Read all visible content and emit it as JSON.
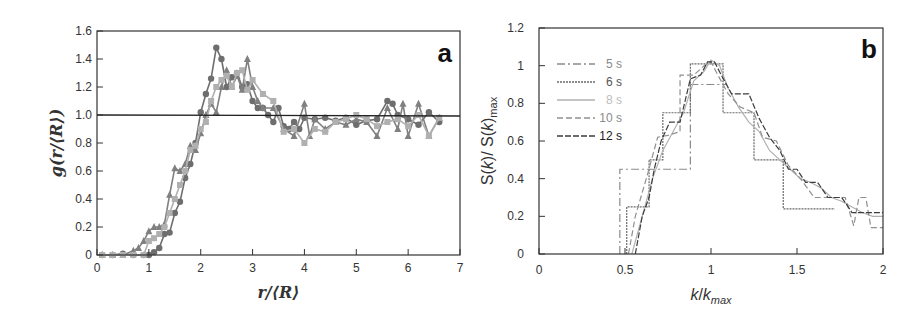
{
  "chart_data": [
    {
      "panel": "a",
      "type": "line",
      "title": "",
      "xlabel": "r/⟨R⟩",
      "ylabel": "g(r/⟨R⟩)",
      "xlim": [
        0,
        7
      ],
      "ylim": [
        0,
        1.6
      ],
      "xticks": [
        "0",
        "1",
        "2",
        "3",
        "4",
        "5",
        "6",
        "7"
      ],
      "yticks": [
        "0",
        "0.2",
        "0.4",
        "0.6",
        "0.8",
        "1.0",
        "1.2",
        "1.4",
        "1.6"
      ],
      "reference_line": 1.0,
      "grid": false,
      "legend": null,
      "series": [
        {
          "name": "circles",
          "marker": "circle",
          "color": "#6e6e6e",
          "x": [
            0.1,
            0.3,
            0.5,
            0.7,
            0.9,
            1.0,
            1.1,
            1.2,
            1.3,
            1.4,
            1.5,
            1.6,
            1.7,
            1.8,
            1.9,
            2.0,
            2.1,
            2.2,
            2.3,
            2.4,
            2.5,
            2.6,
            2.7,
            2.8,
            2.9,
            3.0,
            3.1,
            3.2,
            3.3,
            3.4,
            3.5,
            3.6,
            3.7,
            3.8,
            3.9,
            4.0,
            4.2,
            4.4,
            4.6,
            4.8,
            5.0,
            5.2,
            5.4,
            5.6,
            5.7,
            5.8,
            6.0,
            6.2,
            6.4,
            6.6
          ],
          "y": [
            0,
            0,
            0.01,
            0,
            0,
            0,
            0.02,
            0.05,
            0.15,
            0.16,
            0.3,
            0.38,
            0.55,
            0.65,
            0.8,
            1.02,
            1.15,
            1.26,
            1.48,
            1.4,
            1.2,
            1.27,
            1.3,
            1.2,
            1.22,
            1.1,
            1.05,
            1.05,
            1.0,
            0.95,
            1.05,
            0.92,
            0.9,
            0.95,
            0.9,
            0.98,
            0.97,
            0.98,
            0.96,
            0.98,
            0.93,
            0.96,
            0.97,
            1.1,
            1.08,
            1.0,
            0.97,
            0.93,
            1.02,
            0.95
          ]
        },
        {
          "name": "triangles",
          "marker": "triangle",
          "color": "#808080",
          "x": [
            0.1,
            0.3,
            0.5,
            0.7,
            0.8,
            0.9,
            1.0,
            1.1,
            1.2,
            1.3,
            1.4,
            1.5,
            1.6,
            1.7,
            1.8,
            1.9,
            2.0,
            2.1,
            2.2,
            2.3,
            2.4,
            2.5,
            2.6,
            2.7,
            2.8,
            2.9,
            3.0,
            3.1,
            3.2,
            3.4,
            3.6,
            3.8,
            4.0,
            4.1,
            4.2,
            4.4,
            4.6,
            4.8,
            5.0,
            5.2,
            5.4,
            5.6,
            5.8,
            5.9,
            6.0,
            6.2,
            6.4,
            6.6
          ],
          "y": [
            0,
            0,
            0,
            0.03,
            0.05,
            0.1,
            0.17,
            0.2,
            0.2,
            0.22,
            0.43,
            0.62,
            0.6,
            0.65,
            0.78,
            0.75,
            0.87,
            1.0,
            1.08,
            1.02,
            1.2,
            1.32,
            1.2,
            1.28,
            1.18,
            1.4,
            1.2,
            1.1,
            1.05,
            1.05,
            0.9,
            0.85,
            1.08,
            0.85,
            0.97,
            0.9,
            0.95,
            0.93,
            0.97,
            0.95,
            0.85,
            1.05,
            0.9,
            1.08,
            0.85,
            1.08,
            0.85,
            0.98
          ]
        },
        {
          "name": "squares",
          "marker": "square",
          "color": "#b0b0b0",
          "x": [
            0.1,
            0.3,
            0.5,
            0.7,
            0.9,
            1.0,
            1.1,
            1.2,
            1.3,
            1.4,
            1.5,
            1.6,
            1.7,
            1.8,
            1.9,
            2.0,
            2.1,
            2.2,
            2.3,
            2.4,
            2.5,
            2.6,
            2.7,
            2.8,
            2.9,
            3.0,
            3.2,
            3.4,
            3.6,
            3.8,
            4.0,
            4.2,
            4.4,
            4.6,
            4.8,
            5.0,
            5.2,
            5.4,
            5.6,
            5.8,
            6.0,
            6.2,
            6.4,
            6.6
          ],
          "y": [
            0,
            0,
            0,
            0,
            0,
            0.1,
            0.12,
            0.15,
            0.2,
            0.3,
            0.4,
            0.5,
            0.6,
            0.75,
            0.78,
            0.9,
            0.95,
            1.1,
            1.2,
            1.25,
            1.28,
            1.2,
            1.3,
            1.32,
            1.18,
            1.25,
            1.15,
            1.1,
            0.88,
            0.9,
            0.8,
            0.9,
            0.88,
            0.95,
            0.97,
            1.0,
            0.97,
            0.92,
            0.95,
            0.97,
            0.92,
            1.0,
            0.85,
            0.98
          ]
        }
      ]
    },
    {
      "panel": "b",
      "type": "line",
      "title": "",
      "xlabel": "k/k_max",
      "ylabel": "S(k)/ S(k)_max",
      "xlim": [
        0,
        2
      ],
      "ylim": [
        0,
        1.2
      ],
      "xticks": [
        "0",
        "0.5",
        "1",
        "1.5",
        "2"
      ],
      "yticks": [
        "0",
        "0.2",
        "0.4",
        "0.6",
        "0.8",
        "1",
        "1.2"
      ],
      "grid": false,
      "legend_position": "upper-left",
      "series": [
        {
          "name": "5 s",
          "dash": "8 3 2 3",
          "color": "#8a8a8a",
          "x": [
            0.47,
            0.47,
            0.88,
            0.88,
            1.09
          ],
          "y": [
            0,
            0.45,
            0.45,
            0.9,
            0.9
          ]
        },
        {
          "name": "6 s",
          "dash": "2 1",
          "color": "#6a6a6a",
          "x": [
            0.51,
            0.51,
            0.64,
            0.64,
            0.72,
            0.72,
            0.88,
            0.88,
            1.07,
            1.07,
            1.25,
            1.25,
            1.42,
            1.42,
            1.72
          ],
          "y": [
            0,
            0.25,
            0.25,
            0.5,
            0.5,
            0.75,
            0.75,
            1.01,
            1.01,
            0.75,
            0.75,
            0.5,
            0.5,
            0.24,
            0.24
          ]
        },
        {
          "name": "8 s",
          "dash": "",
          "color": "#b0b0b0",
          "x": [
            0.54,
            0.6,
            0.66,
            0.72,
            0.78,
            0.84,
            0.9,
            0.96,
            1.0,
            1.05,
            1.1,
            1.16,
            1.22,
            1.28,
            1.34,
            1.4,
            1.46,
            1.52,
            1.58,
            1.64,
            1.7,
            1.76,
            1.82,
            1.88,
            1.94,
            2.0
          ],
          "y": [
            0,
            0.2,
            0.4,
            0.55,
            0.65,
            0.75,
            0.92,
            0.97,
            1.03,
            1.0,
            0.88,
            0.78,
            0.7,
            0.65,
            0.55,
            0.5,
            0.45,
            0.4,
            0.38,
            0.35,
            0.3,
            0.28,
            0.25,
            0.22,
            0.2,
            0.2
          ]
        },
        {
          "name": "10 s",
          "dash": "6 3",
          "color": "#909090",
          "x": [
            0.52,
            0.56,
            0.63,
            0.69,
            0.75,
            0.82,
            0.82,
            0.9,
            0.96,
            1.0,
            1.04,
            1.1,
            1.17,
            1.25,
            1.3,
            1.38,
            1.45,
            1.52,
            1.6,
            1.68,
            1.78,
            1.83,
            1.86,
            1.9,
            1.93,
            2.0
          ],
          "y": [
            0,
            0.2,
            0.42,
            0.62,
            0.63,
            0.65,
            0.95,
            0.95,
            1.0,
            1.02,
            0.95,
            0.85,
            0.78,
            0.75,
            0.62,
            0.6,
            0.47,
            0.4,
            0.3,
            0.3,
            0.3,
            0.15,
            0.3,
            0.3,
            0.14,
            0.14
          ]
        },
        {
          "name": "12 s",
          "dash": "6 2",
          "color": "#3c3c3c",
          "x": [
            0.56,
            0.6,
            0.64,
            0.67,
            0.71,
            0.76,
            0.82,
            0.88,
            0.94,
            0.98,
            1.02,
            1.06,
            1.12,
            1.22,
            1.28,
            1.34,
            1.4,
            1.45,
            1.5,
            1.55,
            1.62,
            1.68,
            1.76,
            1.82,
            1.88,
            2.0
          ],
          "y": [
            0,
            0.2,
            0.3,
            0.45,
            0.6,
            0.7,
            0.7,
            0.93,
            0.95,
            1.02,
            1.02,
            0.95,
            0.85,
            0.85,
            0.72,
            0.62,
            0.55,
            0.45,
            0.45,
            0.38,
            0.38,
            0.3,
            0.3,
            0.22,
            0.22,
            0.22
          ]
        }
      ]
    }
  ],
  "panels": {
    "a": {
      "label": "a"
    },
    "b": {
      "label": "b"
    }
  }
}
